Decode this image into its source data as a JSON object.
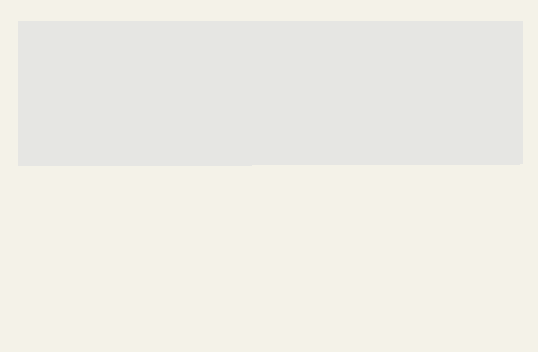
{
  "map": {
    "title": "1940 Presidential Election",
    "colors": {
      "background": "#f4f2e8",
      "panel": "#e6e6e3",
      "willkie_fill": "#9c9c9a",
      "roosevelt_fill": "#8e8e8c",
      "hatch_line": "#505050",
      "border_dash": "#2a2a2a"
    },
    "states": [
      {
        "abbr": "WASH",
        "votes": "8",
        "winner": "Roosevelt"
      },
      {
        "abbr": "ORE",
        "votes": "5",
        "winner": "Roosevelt"
      },
      {
        "abbr": "CALIF",
        "votes": "22",
        "winner": "Roosevelt"
      },
      {
        "abbr": "NEV",
        "votes": "3",
        "winner": "Roosevelt"
      },
      {
        "abbr": "IDA",
        "votes": "4",
        "winner": "Roosevelt"
      },
      {
        "abbr": "MONT",
        "votes": "4",
        "winner": "Roosevelt"
      },
      {
        "abbr": "WYO",
        "votes": "3",
        "winner": "Roosevelt"
      },
      {
        "abbr": "UTAH",
        "votes": "4",
        "winner": "Roosevelt"
      },
      {
        "abbr": "ARIZ",
        "votes": "3",
        "winner": "Roosevelt"
      },
      {
        "abbr": "COLO",
        "votes": "6",
        "winner": "Willkie"
      },
      {
        "abbr": "N.M",
        "votes": "3",
        "winner": "Roosevelt"
      },
      {
        "abbr": "N.D",
        "votes": "4",
        "winner": "Willkie"
      },
      {
        "abbr": "S.D",
        "votes": "4",
        "winner": "Willkie"
      },
      {
        "abbr": "NEB",
        "votes": "7",
        "winner": "Willkie"
      },
      {
        "abbr": "KANS",
        "votes": "9",
        "winner": "Willkie"
      },
      {
        "abbr": "OKLA",
        "votes": "11",
        "winner": "Roosevelt"
      },
      {
        "abbr": "TEX",
        "votes": "23",
        "winner": "Roosevelt"
      },
      {
        "abbr": "MINN",
        "votes": "11",
        "winner": "Roosevelt"
      },
      {
        "abbr": "IOWA",
        "votes": "11",
        "winner": "Willkie"
      },
      {
        "abbr": "MO",
        "votes": "15",
        "winner": "Roosevelt"
      },
      {
        "abbr": "ARK",
        "votes": "9",
        "winner": "Roosevelt"
      },
      {
        "abbr": "LA",
        "votes": "10",
        "winner": "Roosevelt"
      },
      {
        "abbr": "WIS",
        "votes": "12",
        "winner": "Roosevelt"
      },
      {
        "abbr": "ILL",
        "votes": "29",
        "winner": "Roosevelt"
      },
      {
        "abbr": "MICH",
        "votes": "19",
        "winner": "Willkie"
      },
      {
        "abbr": "IND",
        "votes": "14",
        "winner": "Willkie"
      },
      {
        "abbr": "OHIO",
        "votes": "26",
        "winner": "Roosevelt"
      },
      {
        "abbr": "KY",
        "votes": "11",
        "winner": "Roosevelt"
      },
      {
        "abbr": "TENN",
        "votes": "11",
        "winner": "Roosevelt"
      },
      {
        "abbr": "MISS",
        "votes": "9",
        "winner": "Roosevelt"
      },
      {
        "abbr": "ALA",
        "votes": "11",
        "winner": "Roosevelt"
      },
      {
        "abbr": "GA",
        "votes": "12",
        "winner": "Roosevelt"
      },
      {
        "abbr": "FLA",
        "votes": "7",
        "winner": "Roosevelt"
      },
      {
        "abbr": "S.C",
        "votes": "8",
        "winner": "Roosevelt"
      },
      {
        "abbr": "N.C",
        "votes": "13",
        "winner": "Roosevelt"
      },
      {
        "abbr": "VA",
        "votes": "11",
        "winner": "Roosevelt"
      },
      {
        "abbr": "W.VA",
        "votes": "8",
        "winner": "Roosevelt"
      },
      {
        "abbr": "PENNA",
        "votes": "36",
        "winner": "Roosevelt"
      },
      {
        "abbr": "N.Y",
        "votes": "47",
        "winner": "Roosevelt"
      },
      {
        "abbr": "V.T.",
        "votes": "3",
        "winner": "Willkie"
      },
      {
        "abbr": "N.H.",
        "votes": "4",
        "winner": "Roosevelt"
      },
      {
        "abbr": "ME.",
        "votes": "5",
        "winner": "Willkie"
      },
      {
        "abbr": "MASS.",
        "votes": "17",
        "winner": "Roosevelt"
      },
      {
        "abbr": "R.I.",
        "votes": "4",
        "winner": "Roosevelt"
      },
      {
        "abbr": "CONN.",
        "votes": "8",
        "winner": "Roosevelt"
      },
      {
        "abbr": "N.J.",
        "votes": "16",
        "winner": "Roosevelt"
      },
      {
        "abbr": "DEL.",
        "votes": "3",
        "winner": "Roosevelt"
      },
      {
        "abbr": "MD.",
        "votes": "8",
        "winner": "Roosevelt"
      }
    ],
    "labels": {
      "wash": "WASH",
      "wash_v": "8",
      "ore": "ORE",
      "ore_v": "5",
      "calif": "CALIF",
      "calif_v": "22",
      "nev": "NEV",
      "nev_v": "3",
      "ida": "IDA",
      "ida_v": "4",
      "mont": "MONT",
      "mont_v": "4",
      "wyo": "WYO",
      "wyo_v": "3",
      "utah": "UTAH",
      "utah_v": "4",
      "ariz": "ARIZ",
      "ariz_v": "3",
      "colo": "COLO",
      "colo_v": "6",
      "nm": "N.M",
      "nm_v": "3",
      "nd": "N.D",
      "nd_v": "4",
      "sd": "S.D",
      "sd_v": "4",
      "neb": "NEB",
      "neb_v": "7",
      "kans": "KANS",
      "kans_v": "9",
      "okla": "OKLA",
      "okla_v": "11",
      "tex": "TEX",
      "tex_v": "23",
      "minn": "MINN",
      "minn_v": "11",
      "iowa": "IOWA",
      "iowa_v": "11",
      "mo": "MO",
      "mo_v": "15",
      "ark": "ARK",
      "ark_v": "9",
      "la": "LA",
      "la_v": "10",
      "wis": "WIS",
      "wis_v": "12",
      "ill": "ILL",
      "ill_v": "29",
      "mich": "MICH",
      "mich_v": "19",
      "ind": "IND",
      "ind_v": "14",
      "ohio": "OHIO",
      "ohio_v": "26",
      "ky": "KY",
      "ky_v": "11",
      "tenn": "TENN",
      "tenn_v": "11",
      "miss": "MISS",
      "miss_v": "9",
      "ala": "ALA",
      "ala_v": "11",
      "ga": "GA",
      "ga_v": "12",
      "fla": "FLA",
      "fla_v": "7",
      "sc": "S.C",
      "sc_v": "8",
      "nc": "N.C",
      "nc_v": "13",
      "va": "VA",
      "va_v": "11",
      "wva_w": "W",
      "wva": "VA",
      "wva_v": "8",
      "penna": "PENNA",
      "penna_v": "36",
      "ny": "N.Y",
      "ny_v": "47",
      "vt": "V.T.",
      "vt_v": "3",
      "nh": "N.H.",
      "nh_v": "4",
      "me": "ME.",
      "me_v": "5",
      "mass": "MASS.",
      "mass_v": "17",
      "ri": "R.I.  4",
      "conn": "CONN.  8",
      "nj": "N.J.",
      "nj_v": "16",
      "del": "DEL.",
      "del_v": "3",
      "md": "MD.8"
    }
  },
  "legend": {
    "col_electoral": "Electoral",
    "col_popular": "Popular",
    "rows": [
      {
        "candidate": "Roosevelt (Dem.)",
        "electoral": "449",
        "popular": "27,308,000",
        "pattern": "hatched"
      },
      {
        "candidate": "Willkie (Rep.)",
        "electoral": "82",
        "popular": "22,321,000",
        "pattern": "solid"
      }
    ]
  }
}
